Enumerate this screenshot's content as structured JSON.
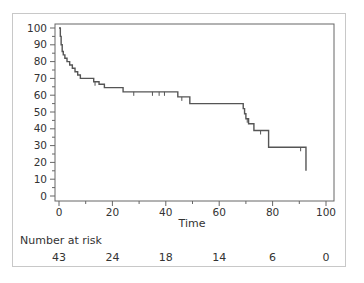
{
  "chart_data": {
    "type": "line",
    "subtype": "kaplan-meier step curve",
    "title": "",
    "xlabel": "Time",
    "ylabel": "",
    "xlim": [
      0,
      100
    ],
    "ylim": [
      0,
      100
    ],
    "x_ticks": [
      0,
      20,
      40,
      60,
      80,
      100
    ],
    "y_ticks": [
      0,
      10,
      20,
      30,
      40,
      50,
      60,
      70,
      80,
      90,
      100
    ],
    "grid": false,
    "legend": null,
    "series": [
      {
        "name": "Survival",
        "steps": [
          [
            0,
            100
          ],
          [
            0.5,
            95
          ],
          [
            0.8,
            90
          ],
          [
            1.2,
            86
          ],
          [
            1.6,
            84
          ],
          [
            2.2,
            82
          ],
          [
            3,
            80
          ],
          [
            4,
            78
          ],
          [
            5,
            76
          ],
          [
            6,
            74
          ],
          [
            7,
            72
          ],
          [
            8,
            70
          ],
          [
            13,
            68
          ],
          [
            15,
            66.5
          ],
          [
            17,
            64.5
          ],
          [
            24,
            62
          ],
          [
            44.5,
            59
          ],
          [
            49,
            55
          ],
          [
            69,
            52
          ],
          [
            69.5,
            49
          ],
          [
            70,
            46
          ],
          [
            71,
            43
          ],
          [
            73,
            39
          ],
          [
            78.5,
            29
          ],
          [
            92.5,
            15
          ]
        ],
        "censored": [
          [
            13.5,
            68
          ],
          [
            28,
            62
          ],
          [
            35,
            62
          ],
          [
            37.5,
            62
          ],
          [
            39.5,
            62
          ],
          [
            46,
            59
          ],
          [
            70.5,
            46
          ],
          [
            75.5,
            39
          ],
          [
            90.5,
            29
          ]
        ],
        "end_time": 92.5
      }
    ],
    "number_at_risk": {
      "label": "Number at risk",
      "times": [
        0,
        20,
        40,
        60,
        80,
        100
      ],
      "values": [
        43,
        24,
        18,
        14,
        6,
        0
      ]
    }
  },
  "risk_table": {
    "title": "Number at risk",
    "values": [
      "43",
      "24",
      "18",
      "14",
      "6",
      "0"
    ]
  },
  "axes": {
    "x_title": "Time"
  },
  "colors": {
    "line": "#555555",
    "axis": "#666666",
    "frame": "#c8c8c8"
  }
}
